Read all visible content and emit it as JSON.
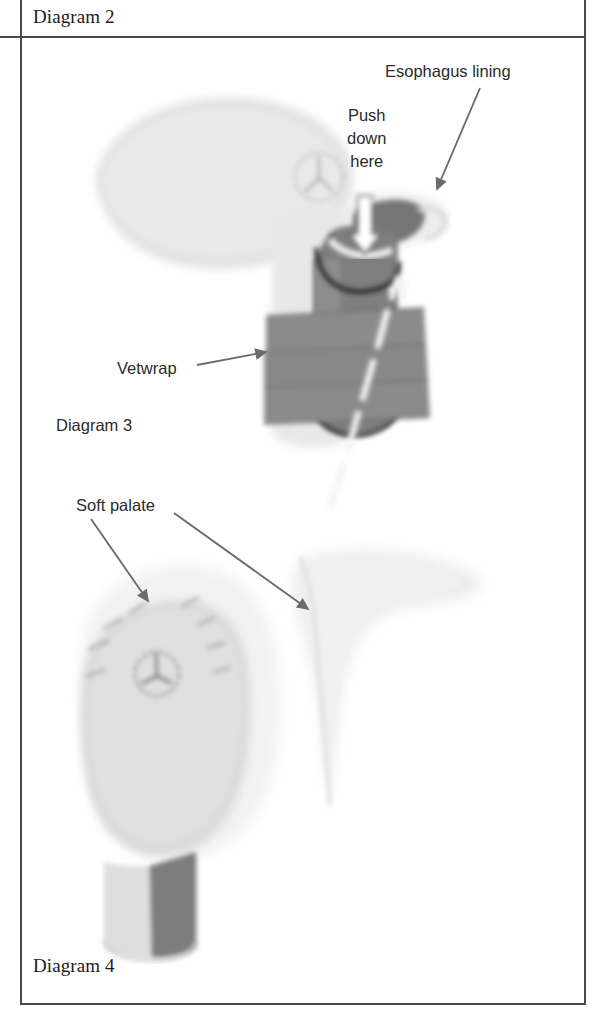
{
  "figure": {
    "kind": "scanned-instructional-diagram",
    "background_color": "#ffffff",
    "frame_color": "#4a4a4a"
  },
  "captions": {
    "diagram2": "Diagram 2",
    "diagram3": "Diagram 3",
    "diagram4": "Diagram 4"
  },
  "callouts": {
    "esophagus_lining": "Esophagus lining",
    "push_down_here": "Push\ndown\nhere",
    "vetwrap": "Vetwrap",
    "soft_palate": "Soft palate"
  },
  "palette": {
    "ink": "#1c1c1c",
    "label_ink": "#2b2b2b",
    "frame": "#4a4a4a",
    "tissue_light": "#e3e3e3",
    "tissue_pale": "#eeeeee",
    "tissue_mid": "#d2d2d2",
    "tube_dark": "#7b7b7b",
    "tube_darker": "#6e6e6e",
    "wrap_gray": "#8a8a8a",
    "arrow_gray": "#6b6b6b",
    "dash_white": "#f2f2f2"
  },
  "artwork": {
    "diagram2_top_lobe": {
      "name": "pharynx-tissue-lobe",
      "fill": "#e6e6e6",
      "note": "large soft leaf-shaped tissue mass upper-left"
    },
    "diagram2_marker_circle": {
      "name": "palpation-marker-circle",
      "stroke": "#9a9a9a",
      "radius_px": 24,
      "center": [
        318,
        176
      ]
    },
    "diagram2_tube": {
      "name": "trachea-tube",
      "fill": "#7b7b7b",
      "outline": "#2a2a2a",
      "note": "vertical cylinder with elliptical open top"
    },
    "diagram2_wrap_bands": {
      "name": "vetwrap-bands",
      "fill": "#8a8a8a",
      "count": 3
    },
    "diagram2_push_arrow": {
      "name": "push-down-hollow-arrow",
      "fill": "#ffffff",
      "stroke": "#5a5a5a",
      "direction": "down"
    },
    "diagram2_flow_arrow": {
      "name": "airflow-dashed-arrow",
      "color": "#f2f2f2",
      "direction": "up",
      "style": "dashed"
    },
    "diagram3_palate": {
      "name": "soft-palate-tissue",
      "fill": "#ededed",
      "note": "tapered tri-lobed pale shape, mid-right"
    },
    "diagram4_body": {
      "name": "pharynx-cross-section",
      "fill": "#dcdcdc"
    },
    "diagram4_marker_circle": {
      "name": "palpation-marker-circle",
      "stroke": "#6f6f6f",
      "radius_px": 22,
      "center": [
        157,
        674
      ]
    },
    "diagram4_tube": {
      "name": "trachea-stub",
      "fill_light": "#dcdcdc",
      "fill_dark": "#7b7b7b"
    },
    "diagram4_hair_ticks": {
      "name": "tissue-fold-ticks",
      "color": "#b9b9b9",
      "count": 7
    }
  },
  "arrows": {
    "esophagus_leader": {
      "name": "esophagus-leader-arrow",
      "from": [
        480,
        88
      ],
      "to": [
        436,
        190
      ],
      "color": "#6b6b6b"
    },
    "vetwrap_leader": {
      "name": "vetwrap-leader-arrow",
      "from": [
        196,
        364
      ],
      "to": [
        264,
        352
      ],
      "color": "#6b6b6b"
    },
    "soft_palate_leader_left": {
      "name": "soft-palate-leader-arrow-left",
      "from": [
        92,
        520
      ],
      "to": [
        146,
        600
      ],
      "color": "#6b6b6b"
    },
    "soft_palate_leader_right": {
      "name": "soft-palate-leader-arrow-right",
      "from": [
        175,
        513
      ],
      "to": [
        307,
        608
      ],
      "color": "#6b6b6b"
    }
  }
}
